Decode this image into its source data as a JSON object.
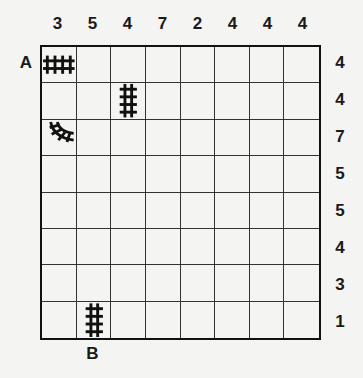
{
  "puzzle": {
    "column_clues": [
      "3",
      "5",
      "4",
      "7",
      "2",
      "4",
      "4",
      "4"
    ],
    "row_clues": [
      "4",
      "4",
      "7",
      "5",
      "5",
      "4",
      "3",
      "1"
    ],
    "start_label": "A",
    "end_label": "B",
    "start_row": 0,
    "end_col": 1,
    "given_pieces": [
      {
        "row": 0,
        "col": 0,
        "type": "straight-horizontal"
      },
      {
        "row": 1,
        "col": 2,
        "type": "straight-vertical"
      },
      {
        "row": 2,
        "col": 0,
        "type": "curve-north-east"
      },
      {
        "row": 7,
        "col": 1,
        "type": "straight-vertical"
      }
    ]
  }
}
